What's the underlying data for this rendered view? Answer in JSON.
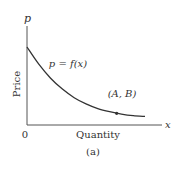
{
  "chart_data": {
    "type": "line",
    "title": "",
    "caption": "(a)",
    "xlabel": "Quantity",
    "ylabel": "Price",
    "x_axis_symbol": "x",
    "y_axis_symbol": "p",
    "x_ticks": [
      "0"
    ],
    "curve_label": "p = f(x)",
    "point_label": "(A, B)",
    "series": [
      {
        "name": "p = f(x)",
        "description": "decreasing convex demand curve",
        "x": [
          0,
          0.1,
          0.2,
          0.3,
          0.4,
          0.5,
          0.6,
          0.7,
          0.8,
          0.9,
          1.0
        ],
        "y": [
          1.0,
          0.78,
          0.6,
          0.46,
          0.35,
          0.27,
          0.21,
          0.17,
          0.14,
          0.12,
          0.11
        ]
      }
    ],
    "highlight_point": {
      "label": "(A, B)",
      "x": 0.76,
      "y": 0.15
    },
    "xlim": [
      0,
      1.2
    ],
    "ylim": [
      0,
      1.3
    ],
    "grid": false,
    "colors": {
      "curve": "#333333",
      "axis": "#555555",
      "text": "#333333"
    }
  }
}
